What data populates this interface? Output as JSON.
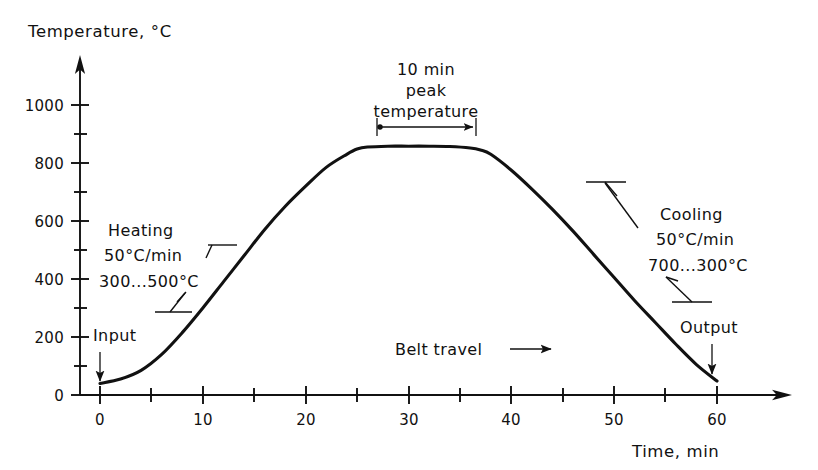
{
  "chart_data": {
    "type": "line",
    "title": "",
    "xlabel": "Time, min",
    "ylabel": "Temperature, °C",
    "xlim": [
      0,
      60
    ],
    "ylim": [
      0,
      1050
    ],
    "grid": false,
    "legend": "none",
    "x_ticks": [
      0,
      10,
      20,
      30,
      40,
      50,
      60
    ],
    "x_minor_ticks": [
      5,
      15,
      25,
      35,
      45,
      55
    ],
    "y_ticks": [
      0,
      200,
      400,
      600,
      800,
      1000
    ],
    "y_minor_ticks": [
      100,
      300,
      500,
      700,
      900
    ],
    "series": [
      {
        "name": "Belt furnace thermal profile",
        "x": [
          0,
          2,
          4,
          6,
          8,
          10,
          12,
          14,
          16,
          18,
          20,
          22,
          24,
          25,
          26,
          28,
          30,
          32,
          34,
          36,
          37,
          38,
          40,
          42,
          44,
          46,
          48,
          50,
          52,
          54,
          56,
          58,
          60
        ],
        "y": [
          40,
          55,
          85,
          140,
          215,
          300,
          390,
          480,
          570,
          650,
          720,
          785,
          830,
          848,
          855,
          858,
          858,
          858,
          857,
          852,
          845,
          830,
          775,
          710,
          640,
          565,
          485,
          405,
          325,
          250,
          175,
          105,
          48
        ]
      }
    ],
    "annotations": [
      {
        "name": "heating",
        "lines": [
          "Heating",
          "50°C/min",
          "300...500°C"
        ]
      },
      {
        "name": "cooling",
        "lines": [
          "Cooling",
          "50°C/min",
          "700...300°C"
        ]
      },
      {
        "name": "peak",
        "lines": [
          "10 min",
          "peak",
          "temperature"
        ],
        "span_min": [
          25,
          35
        ]
      },
      {
        "name": "belt-travel",
        "text": "Belt travel"
      },
      {
        "name": "input",
        "text": "Input",
        "at_min": 0
      },
      {
        "name": "output",
        "text": "Output",
        "at_min": 60
      }
    ]
  },
  "axes": {
    "y_title": "Temperature, °C",
    "x_title": "Time, min",
    "y_tick_labels": [
      "1000",
      "800",
      "600",
      "400",
      "200",
      "0"
    ],
    "x_tick_labels": [
      "0",
      "10",
      "20",
      "30",
      "40",
      "50",
      "60"
    ]
  },
  "labels": {
    "heating_line1": "Heating",
    "heating_line2": "50°C/min",
    "heating_line3": "300...500°C",
    "cooling_line1": "Cooling",
    "cooling_line2": "50°C/min",
    "cooling_line3": "700...300°C",
    "peak_line1": "10 min",
    "peak_line2": "peak",
    "peak_line3": "temperature",
    "belt_travel": "Belt travel",
    "input": "Input",
    "output": "Output"
  },
  "colors": {
    "ink": "#111111",
    "background": "#ffffff"
  }
}
